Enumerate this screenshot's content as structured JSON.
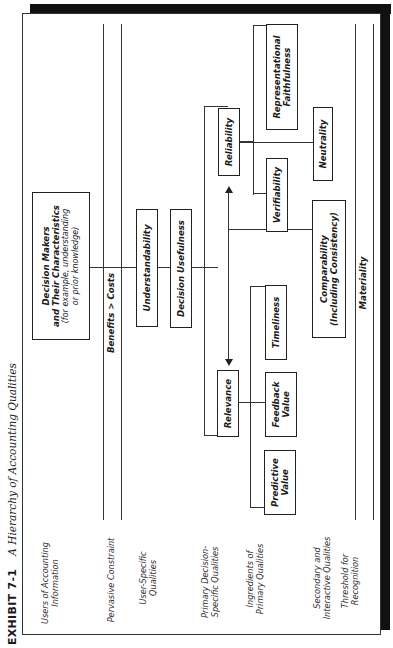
{
  "exhibit": {
    "number": "EXHIBIT 7-1",
    "title": "A Hierarchy of Accounting Qualities"
  },
  "row_labels": {
    "users": "Users of Accounting Information",
    "pervasive": "Pervasive Constraint",
    "user_specific": "User-Specific Qualities",
    "primary": "Primary Decision-Specific Qualities",
    "ingredients": "Ingredients of Primary Qualities",
    "secondary": "Secondary and Interactive Qualities",
    "threshold": "Threshold for Recognition"
  },
  "nodes": {
    "decision_makers_title1": "Decision Makers",
    "decision_makers_title2": "and Their Characteristics",
    "decision_makers_sub": "(for example, understanding or prior knowledge)",
    "benefits_costs": "Benefits > Costs",
    "understandability": "Understandability",
    "decision_usefulness": "Decision Usefulness",
    "relevance": "Relevance",
    "reliability": "Reliability",
    "predictive_value": "Predictive Value",
    "feedback_value": "Feedback Value",
    "timeliness": "Timeliness",
    "verifiability": "Verifiability",
    "representational_faithfulness": "Representational Faithfulness",
    "comparability": "Comparability",
    "comparability_sub": "(Including Consistency)",
    "neutrality": "Neutrality",
    "materiality": "Materiality"
  }
}
